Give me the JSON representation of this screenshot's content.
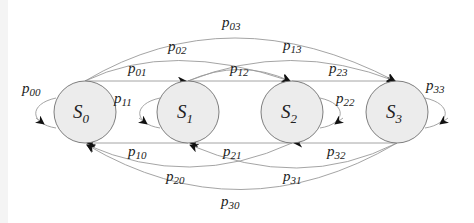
{
  "diagram": {
    "type": "markov-chain-state-transition",
    "colors": {
      "state_fill": "#ececec",
      "state_stroke": "#707070",
      "edge": "#9a9a9a",
      "arrow": "#111111",
      "text": "#222222"
    },
    "states": [
      {
        "id": "S0",
        "base": "S",
        "sub": "0"
      },
      {
        "id": "S1",
        "base": "S",
        "sub": "1"
      },
      {
        "id": "S2",
        "base": "S",
        "sub": "2"
      },
      {
        "id": "S3",
        "base": "S",
        "sub": "3"
      }
    ],
    "transitions": {
      "p00": {
        "base": "p",
        "sub": "00",
        "from": "S0",
        "to": "S0"
      },
      "p01": {
        "base": "p",
        "sub": "01",
        "from": "S0",
        "to": "S1"
      },
      "p02": {
        "base": "p",
        "sub": "02",
        "from": "S0",
        "to": "S2"
      },
      "p03": {
        "base": "p",
        "sub": "03",
        "from": "S0",
        "to": "S3"
      },
      "p11": {
        "base": "p",
        "sub": "11",
        "from": "S1",
        "to": "S1"
      },
      "p12": {
        "base": "p",
        "sub": "12",
        "from": "S1",
        "to": "S2"
      },
      "p13": {
        "base": "p",
        "sub": "13",
        "from": "S1",
        "to": "S3"
      },
      "p22": {
        "base": "p",
        "sub": "22",
        "from": "S2",
        "to": "S2"
      },
      "p23": {
        "base": "p",
        "sub": "23",
        "from": "S2",
        "to": "S3"
      },
      "p33": {
        "base": "p",
        "sub": "33",
        "from": "S3",
        "to": "S3"
      },
      "p10": {
        "base": "p",
        "sub": "10",
        "from": "S1",
        "to": "S0"
      },
      "p20": {
        "base": "p",
        "sub": "20",
        "from": "S2",
        "to": "S0"
      },
      "p21": {
        "base": "p",
        "sub": "21",
        "from": "S2",
        "to": "S1"
      },
      "p30": {
        "base": "p",
        "sub": "30",
        "from": "S3",
        "to": "S0"
      },
      "p31": {
        "base": "p",
        "sub": "31",
        "from": "S3",
        "to": "S1"
      },
      "p32": {
        "base": "p",
        "sub": "32",
        "from": "S3",
        "to": "S2"
      }
    }
  }
}
